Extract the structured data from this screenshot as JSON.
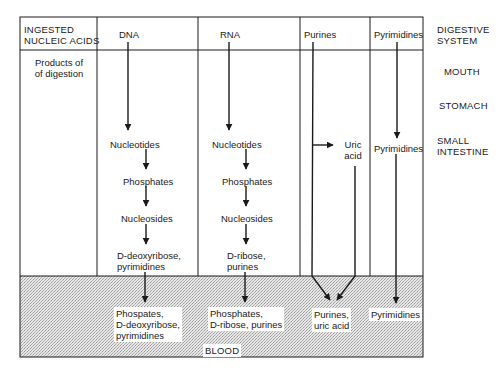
{
  "header": {
    "corner_label_line1": "INGESTED",
    "corner_label_line2": "NUCLEIC ACIDS",
    "columns": [
      "DNA",
      "RNA",
      "Purines",
      "Pyrimidines"
    ],
    "system_label_line1": "DIGESTIVE",
    "system_label_line2": "SYSTEM"
  },
  "row_label": {
    "line1": "Products of",
    "line2": "of digestion"
  },
  "organs": {
    "mouth": "MOUTH",
    "stomach": "STOMACH",
    "small_intestine_line1": "SMALL",
    "small_intestine_line2": "INTESTINE",
    "blood": "BLOOD"
  },
  "dna_column": {
    "nucleotides": "Nucleotides",
    "phosphates": "Phosphates",
    "nucleosides": "Nucleosides",
    "sugar_base_line1": "D-deoxyribose,",
    "sugar_base_line2": "pyrimidines",
    "blood_line1": "Phospates,",
    "blood_line2": "D-deoxyribose,",
    "blood_line3": "pyrimidines"
  },
  "rna_column": {
    "nucleotides": "Nucleotides",
    "phosphates": "Phosphates",
    "nucleosides": "Nucleosides",
    "sugar_base_line1": "D-ribose,",
    "sugar_base_line2": "purines",
    "blood_line1": "Phosphates,",
    "blood_line2": "D-ribose, purines"
  },
  "purines_column": {
    "uric_acid_line1": "Uric",
    "uric_acid_line2": "acid",
    "blood_line1": "Purines,",
    "blood_line2": "uric acid"
  },
  "pyrimidines_column": {
    "small_intestine": "Pyrimidines",
    "blood": "Pyrimidines"
  },
  "colors": {
    "line": "#1a1a1a",
    "blood_fill": "#d9d9d9",
    "background": "#ffffff"
  }
}
